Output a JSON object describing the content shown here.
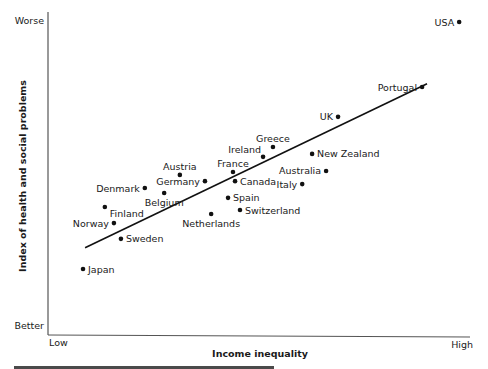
{
  "chart_data": {
    "type": "scatter",
    "title": "",
    "xlabel": "Income inequality",
    "ylabel": "Index of health and social problems",
    "x_tick_labels": {
      "min": "Low",
      "max": "High"
    },
    "y_tick_labels": {
      "min": "Better",
      "max": "Worse"
    },
    "xlim": [
      0,
      10
    ],
    "ylim": [
      0,
      10
    ],
    "grid": false,
    "legend": "none",
    "trendline": {
      "x0": 0.9,
      "y0": 2.6,
      "x1": 9.2,
      "y1": 7.6
    },
    "points": [
      {
        "label": "USA",
        "x": 9.98,
        "y": 9.48,
        "label_side": "left"
      },
      {
        "label": "Portugal",
        "x": 9.08,
        "y": 7.5,
        "label_side": "left"
      },
      {
        "label": "UK",
        "x": 7.04,
        "y": 6.59,
        "label_side": "left"
      },
      {
        "label": "Greece",
        "x": 5.46,
        "y": 5.67,
        "label_side": "top"
      },
      {
        "label": "Ireland",
        "x": 5.22,
        "y": 5.37,
        "label_side": "top-left"
      },
      {
        "label": "New Zealand",
        "x": 6.41,
        "y": 5.46,
        "label_side": "right"
      },
      {
        "label": "Australia",
        "x": 6.75,
        "y": 4.94,
        "label_side": "left"
      },
      {
        "label": "Italy",
        "x": 6.17,
        "y": 4.54,
        "label_side": "left"
      },
      {
        "label": "France",
        "x": 4.49,
        "y": 4.91,
        "label_side": "top"
      },
      {
        "label": "Canada",
        "x": 4.54,
        "y": 4.63,
        "label_side": "right"
      },
      {
        "label": "Spain",
        "x": 4.37,
        "y": 4.12,
        "label_side": "right"
      },
      {
        "label": "Switzerland",
        "x": 4.66,
        "y": 3.75,
        "label_side": "right"
      },
      {
        "label": "Netherlands",
        "x": 3.96,
        "y": 3.63,
        "label_side": "bottom"
      },
      {
        "label": "Austria",
        "x": 3.2,
        "y": 4.82,
        "label_side": "top"
      },
      {
        "label": "Germany",
        "x": 3.81,
        "y": 4.63,
        "label_side": "left"
      },
      {
        "label": "Denmark",
        "x": 2.35,
        "y": 4.42,
        "label_side": "left"
      },
      {
        "label": "Belgium",
        "x": 2.82,
        "y": 4.27,
        "label_side": "bottom"
      },
      {
        "label": "Finland",
        "x": 1.38,
        "y": 3.84,
        "label_side": "bottom-right"
      },
      {
        "label": "Norway",
        "x": 1.6,
        "y": 3.35,
        "label_side": "left"
      },
      {
        "label": "Sweden",
        "x": 1.77,
        "y": 2.87,
        "label_side": "right"
      },
      {
        "label": "Japan",
        "x": 0.85,
        "y": 1.95,
        "label_side": "right"
      }
    ]
  },
  "caption": {
    "text": ""
  }
}
